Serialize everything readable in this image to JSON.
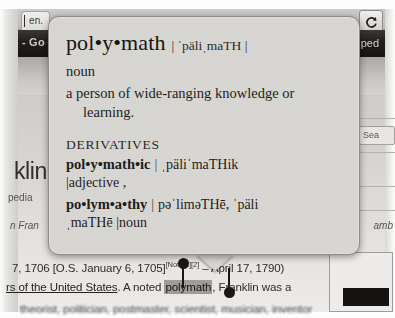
{
  "browser": {
    "tab_label": "en.",
    "reload_icon": "reload-icon",
    "searchbar_left_text": "- Go",
    "searchbar_right_text": "ped"
  },
  "page": {
    "heading_fragment": "klin",
    "encyclopedia_fragment": "pedia",
    "italic_fragment_left": "n Fran",
    "italic_fragment_right": "amb",
    "search_box_label": "Sea",
    "article_lines": {
      "line1_a": "7, 1706 [O.S. January 6, 1705]",
      "line1_sup": "[Note 1]",
      "line1_sup2": "[2]",
      "line1_b": " – April 17, 1790)",
      "line2_link": "rs of the United States",
      "line2_a": ". A noted ",
      "line2_selected": "polymath",
      "line2_b": ", Franklin was a",
      "line3": "theorist, politician, postmaster, scientist, musician, inventor"
    }
  },
  "dictionary": {
    "headword": "pol•y•math",
    "pronunciation": "| ˈpäliˌmaTH |",
    "part_of_speech": "noun",
    "definition_line1": "a person of wide-ranging knowledge or",
    "definition_line2": "learning.",
    "derivatives_label": "DERIVATIVES",
    "derivatives": [
      {
        "word": "pol•y•math•ic",
        "sep": "|",
        "pronunciation": "ˌpäliˈmaTHik",
        "part_of_speech": "|adjective  ,"
      },
      {
        "word": "po•lym•a•thy",
        "sep": "|",
        "pronunciation": "pəˈliməTHē,   ˈpäli",
        "part_of_speech": "ˌmaTHē  |noun"
      }
    ]
  },
  "selection": {
    "start_handle": "selection-start-handle",
    "end_handle": "selection-end-handle"
  },
  "colors": {
    "popup_bg": "#d9d7d3",
    "popup_border": "#8d8c88",
    "text": "#1d1c1a",
    "selection_highlight": "#9e9d99",
    "chrome_dark": "#1d1c1a"
  }
}
